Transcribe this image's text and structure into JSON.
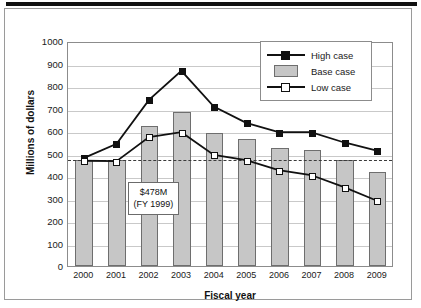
{
  "chart_data": {
    "type": "bar",
    "title": "",
    "subtitle": "",
    "xlabel": "Fiscal year",
    "ylabel": "Millions of dollars",
    "categories": [
      "2000",
      "2001",
      "2002",
      "2003",
      "2004",
      "2005",
      "2006",
      "2007",
      "2008",
      "2009"
    ],
    "ylim": [
      0,
      1000
    ],
    "ytick_step": 100,
    "yticks": [
      "1000",
      "900",
      "800",
      "700",
      "600",
      "500",
      "400",
      "300",
      "200",
      "100",
      "0"
    ],
    "grid": true,
    "legend_position": "top-right",
    "series": [
      {
        "name": "High case",
        "type": "line",
        "marker": "filled-square",
        "color": "#111111",
        "values": [
          485,
          548,
          745,
          875,
          715,
          642,
          600,
          600,
          555,
          518
        ]
      },
      {
        "name": "Base case",
        "type": "bar",
        "color": "#c6c6c6",
        "values": [
          472,
          472,
          622,
          685,
          590,
          565,
          525,
          515,
          472,
          418
        ]
      },
      {
        "name": "Low case",
        "type": "line",
        "marker": "open-square",
        "color": "#111111",
        "values": [
          472,
          470,
          578,
          600,
          498,
          475,
          430,
          408,
          355,
          295
        ]
      }
    ],
    "reference_line": {
      "value": 478,
      "style": "dashed",
      "color": "#3a3a3a",
      "label_line1": "$478M",
      "label_line2": "(FY 1999)"
    },
    "annotation": {
      "line1": "$478M",
      "line2": "(FY 1999)"
    }
  },
  "legend": {
    "items": [
      {
        "label": "High case",
        "key": "line-filled-square-marker"
      },
      {
        "label": "Base case",
        "key": "gray-bar-swatch"
      },
      {
        "label": "Low case",
        "key": "line-open-square-marker"
      }
    ]
  },
  "colors": {
    "bar_fill": "#c6c6c6",
    "bar_stroke": "#6e6e6e",
    "line": "#111111",
    "grid": "#c9c9c9",
    "reference": "#3a3a3a"
  }
}
